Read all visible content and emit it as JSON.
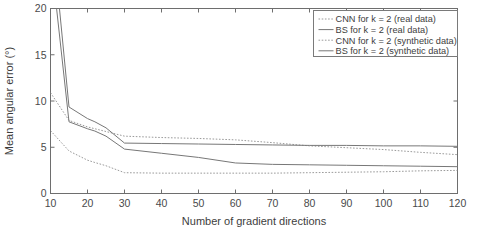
{
  "chart_data": {
    "type": "line",
    "title": "",
    "xlabel": "Number of gradient directions",
    "ylabel": "Mean angular error (°)",
    "xlim": [
      10,
      120
    ],
    "ylim": [
      0,
      20
    ],
    "xticks": [
      10,
      20,
      30,
      40,
      50,
      60,
      70,
      80,
      90,
      100,
      110,
      120
    ],
    "yticks": [
      0,
      5,
      10,
      15,
      20
    ],
    "xticklabels": [
      "10",
      "20",
      "30",
      "40",
      "50",
      "60",
      "70",
      "80",
      "90",
      "100",
      "110",
      "120"
    ],
    "yticklabels": [
      "0",
      "5",
      "10",
      "15",
      "20"
    ],
    "grid": false,
    "legend_position": "upper right",
    "x": [
      10,
      15,
      20,
      22,
      25,
      30,
      40,
      50,
      60,
      70,
      80,
      90,
      100,
      110,
      120
    ],
    "series": [
      {
        "name": "CNN for k = 2 (real data)",
        "style": "dotted",
        "color": "#9a9a9a",
        "values": [
          10.9,
          7.9,
          7.2,
          7.0,
          6.7,
          6.2,
          6.05,
          5.95,
          5.8,
          5.5,
          5.15,
          4.95,
          4.75,
          4.45,
          4.2
        ]
      },
      {
        "name": "BS for k = 2 (real data)",
        "style": "solid",
        "color": "#777777",
        "values": [
          30.0,
          9.35,
          8.1,
          7.75,
          7.1,
          5.45,
          5.4,
          5.35,
          5.3,
          5.25,
          5.2,
          5.2,
          5.15,
          5.15,
          5.1
        ]
      },
      {
        "name": "CNN for k = 2 (synthetic data)",
        "style": "dotted",
        "color": "#9a9a9a",
        "values": [
          6.8,
          4.6,
          3.6,
          3.35,
          3.0,
          2.25,
          2.2,
          2.2,
          2.2,
          2.2,
          2.25,
          2.3,
          2.35,
          2.45,
          2.5
        ]
      },
      {
        "name": "BS for k = 2 (synthetic data)",
        "style": "solid",
        "color": "#777777",
        "values": [
          26.0,
          7.75,
          7.0,
          6.75,
          6.2,
          4.8,
          4.35,
          3.9,
          3.3,
          3.15,
          3.1,
          3.05,
          3.0,
          2.95,
          2.9
        ]
      }
    ]
  },
  "legend": {
    "entries": [
      {
        "label": "CNN for k = 2 (real data)",
        "style": "dotted"
      },
      {
        "label": "BS for k = 2 (real data)",
        "style": "solid"
      },
      {
        "label": "CNN for k = 2 (synthetic data)",
        "style": "dotted"
      },
      {
        "label": "BS for k = 2 (synthetic data)",
        "style": "solid"
      }
    ]
  }
}
